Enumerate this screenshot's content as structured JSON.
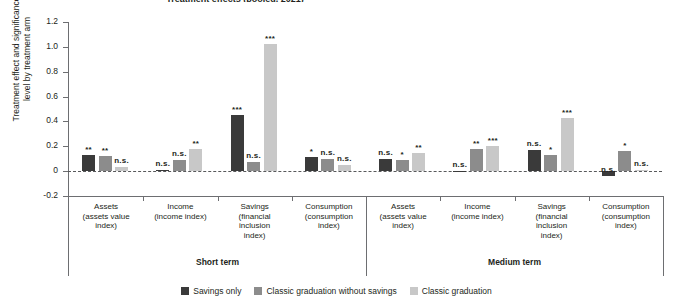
{
  "title": "Treatment effects (pooled, 2021)",
  "axis": {
    "ylabel_line1": "Treatment effect and significance",
    "ylabel_line2": "level by treatment arm",
    "yticks": [
      "1.2",
      "1.0",
      "0.8",
      "0.6",
      "0.4",
      "0.2",
      "0",
      "-0.2"
    ]
  },
  "groups": [
    {
      "label": "Short term"
    },
    {
      "label": "Medium term"
    }
  ],
  "categories": [
    {
      "line1": "Assets",
      "line2": "(assets value",
      "line3": "index)",
      "line4": ""
    },
    {
      "line1": "Income",
      "line2": "(income index)",
      "line3": "",
      "line4": ""
    },
    {
      "line1": "Savings",
      "line2": "(financial",
      "line3": "inclusion",
      "line4": "index)"
    },
    {
      "line1": "Consumption",
      "line2": "(consumption",
      "line3": "index)",
      "line4": ""
    },
    {
      "line1": "Assets",
      "line2": "(assets value",
      "line3": "index)",
      "line4": ""
    },
    {
      "line1": "Income",
      "line2": "(income index)",
      "line3": "",
      "line4": ""
    },
    {
      "line1": "Savings",
      "line2": "(financial",
      "line3": "inclusion",
      "line4": "index)"
    },
    {
      "line1": "Consumption",
      "line2": "(consumption",
      "line3": "index)",
      "line4": ""
    }
  ],
  "legend": [
    {
      "label": "Savings only",
      "color": "#3a3a3a"
    },
    {
      "label": "Classic graduation without savings",
      "color": "#8c8c8c"
    },
    {
      "label": "Classic graduation",
      "color": "#c8c8c8"
    }
  ],
  "chart_data": {
    "type": "bar",
    "title": "Treatment effects (pooled, 2021)",
    "xlabel": "",
    "ylabel": "Treatment effect and significance level by treatment arm",
    "ylim": [
      -0.2,
      1.2
    ],
    "ytick_values": [
      -0.2,
      0,
      0.2,
      0.4,
      0.6,
      0.8,
      1.0,
      1.2
    ],
    "grid": false,
    "legend_position": "bottom",
    "group_labels": [
      "Short term",
      "Medium term"
    ],
    "categories": [
      "Assets (assets value index)",
      "Income (income index)",
      "Savings (financial inclusion index)",
      "Consumption (consumption index)",
      "Assets (assets value index)",
      "Income (income index)",
      "Savings (financial inclusion index)",
      "Consumption (consumption index)"
    ],
    "series": [
      {
        "name": "Savings only",
        "color": "#3a3a3a",
        "values": [
          0.13,
          0.01,
          0.45,
          0.11,
          0.1,
          0.005,
          0.17,
          -0.04
        ],
        "significance": [
          "**",
          "n.s.",
          "***",
          "*",
          "n.s.",
          "n.s.",
          "n.s.",
          "n.s."
        ]
      },
      {
        "name": "Classic graduation without savings",
        "color": "#8c8c8c",
        "values": [
          0.12,
          0.09,
          0.07,
          0.1,
          0.09,
          0.18,
          0.13,
          0.16
        ],
        "significance": [
          "**",
          "n.s.",
          "n.s.",
          "n.s.",
          "*",
          "**",
          "*",
          "*"
        ]
      },
      {
        "name": "Classic graduation",
        "color": "#c8c8c8",
        "values": [
          0.03,
          0.18,
          1.02,
          0.05,
          0.15,
          0.2,
          0.43,
          0.01
        ],
        "significance": [
          "n.s.",
          "**",
          "***",
          "n.s.",
          "**",
          "***",
          "***",
          "n.s."
        ]
      }
    ]
  }
}
